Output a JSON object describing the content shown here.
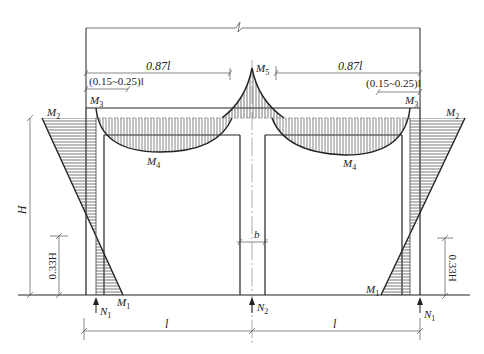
{
  "diagram": {
    "labels": {
      "span_ratio_left": "0.87l",
      "span_ratio_right": "0.87l",
      "inflection_left": "(0.15~0.25)l",
      "inflection_right": "(0.15~0.25)l",
      "m1_left": "M",
      "m1_left_sub": "1",
      "m1_right": "M",
      "m1_right_sub": "1",
      "m2_left": "M",
      "m2_left_sub": "2",
      "m2_right": "M",
      "m2_right_sub": "2",
      "m3_left": "M",
      "m3_left_sub": "3",
      "m3_right": "M",
      "m3_right_sub": "3",
      "m4_left": "M",
      "m4_left_sub": "4",
      "m4_right": "M",
      "m4_right_sub": "4",
      "m5": "M",
      "m5_sub": "5",
      "height": "H",
      "height_033_left": "0.33H",
      "height_033_right": "0.33H",
      "column_width": "b",
      "n1_left": "N",
      "n1_left_sub": "1",
      "n2": "N",
      "n2_sub": "2",
      "n1_right": "N",
      "n1_right_sub": "1",
      "span_left": "l",
      "span_right": "l"
    },
    "colors": {
      "line": "#222222",
      "hatch": "#555555",
      "dim": "#777777"
    }
  }
}
